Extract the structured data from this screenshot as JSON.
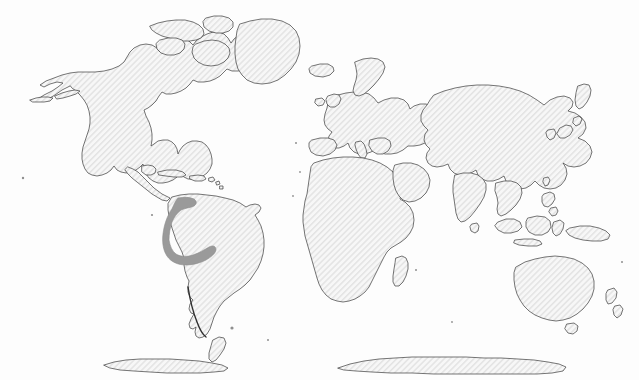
{
  "figure": {
    "kind": "world-distribution-map",
    "projection": "equirectangular",
    "width": 639,
    "height": 380,
    "background_color": "#fdfdfd",
    "title": "",
    "caption": "",
    "has_text_labels": false,
    "has_legend": false,
    "has_graticule": false,
    "has_border_frame": false
  },
  "style": {
    "land_fill_color": "#f2f2f2",
    "land_hatch_color": "#e2e2e2",
    "land_hatch_angle_deg": 45,
    "land_hatch_spacing_px": 3,
    "coastline_color": "#3b3b3b",
    "coastline_width_px": 0.7,
    "highlight_fill_color": "#9a9a9a",
    "highlight_stroke_color": "#8c8c8c",
    "antarctica_fill_color": "#f2f2f2"
  },
  "highlight": {
    "label": "",
    "shape": "andes-crescent",
    "region_name": "Andes / northwestern South America",
    "fill_color": "#9a9a9a",
    "bbox": {
      "x": 165,
      "y": 197,
      "width": 52,
      "height": 56
    }
  },
  "landmasses": [
    {
      "name": "north-america",
      "highlighted": false
    },
    {
      "name": "south-america",
      "highlighted": true
    },
    {
      "name": "greenland",
      "highlighted": false
    },
    {
      "name": "europe",
      "highlighted": false
    },
    {
      "name": "africa",
      "highlighted": false
    },
    {
      "name": "asia",
      "highlighted": false
    },
    {
      "name": "australia",
      "highlighted": false
    },
    {
      "name": "antarctica",
      "highlighted": false
    }
  ]
}
